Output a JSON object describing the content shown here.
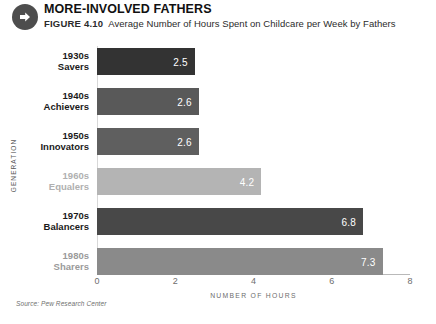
{
  "header": {
    "icon": "arrow-right-circle-icon",
    "title": "MORE-INVOLVED FATHERS",
    "figure_label": "FIGURE 4.10",
    "figure_caption": "Average Number of Hours Spent on Childcare per Week by Fathers"
  },
  "source_note": "Source: Pew Research Center",
  "chart_data": {
    "type": "bar",
    "orientation": "horizontal",
    "title": "Average Number of Hours Spent on Childcare per Week by Fathers",
    "xlabel": "NUMBER OF HOURS",
    "ylabel": "GENERATION",
    "xlim": [
      0,
      8
    ],
    "xticks": [
      "0",
      "2",
      "4",
      "6",
      "8"
    ],
    "grid": false,
    "legend": "none",
    "categories": [
      "1930s Savers",
      "1940s Achievers",
      "1950s Innovators",
      "1960s Equalers",
      "1970s Balancers",
      "1980s Sharers"
    ],
    "category_lines": [
      {
        "decade": "1930s",
        "name": "Savers"
      },
      {
        "decade": "1940s",
        "name": "Achievers"
      },
      {
        "decade": "1950s",
        "name": "Innovators"
      },
      {
        "decade": "1960s",
        "name": "Equalers"
      },
      {
        "decade": "1970s",
        "name": "Balancers"
      },
      {
        "decade": "1980s",
        "name": "Sharers"
      }
    ],
    "values": [
      2.5,
      2.6,
      2.6,
      4.2,
      6.8,
      7.3
    ],
    "value_labels": [
      "2.5",
      "2.6",
      "2.6",
      "4.2",
      "6.8",
      "7.3"
    ],
    "bar_colors": [
      "#333333",
      "#595959",
      "#5f5f5f",
      "#b4b4b4",
      "#484848",
      "#8a8a8a"
    ],
    "label_colors": [
      "#1a1a1a",
      "#1a1a1a",
      "#1a1a1a",
      "#b0b0b0",
      "#1a1a1a",
      "#9a9a9a"
    ]
  }
}
